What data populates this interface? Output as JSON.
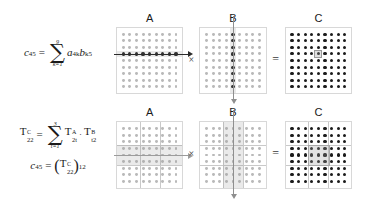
{
  "figure": {
    "background_color": "#ffffff",
    "dot_color_light": "#b9b9b9",
    "dot_color_dark": "#1b1b1b",
    "highlight_color": "#a0a0a0"
  },
  "top_row": {
    "formula": {
      "lhs_var": "c",
      "lhs_sub": "45",
      "equals": "=",
      "sum_symbol": "∑",
      "sum_upper": "9",
      "sum_lower": "k=1",
      "term1_var": "a",
      "term1_sub": "4k",
      "term2_var": "b",
      "term2_sub": "k5"
    },
    "matrices": [
      {
        "label": "A",
        "rows": 9,
        "cols": 9,
        "dot_style": "light",
        "highlight": "row",
        "highlight_index": 4,
        "arrow": "horizontal-right"
      },
      {
        "label": "B",
        "rows": 9,
        "cols": 9,
        "dot_style": "light",
        "highlight": "column",
        "highlight_index": 5,
        "arrow": "vertical-down"
      },
      {
        "label": "C",
        "rows": 9,
        "cols": 9,
        "dot_style": "dark",
        "highlight": "cell",
        "highlight_row": 4,
        "highlight_col": 5,
        "arrow": "none"
      }
    ],
    "operators": {
      "multiply": "×",
      "equals": "="
    }
  },
  "bottom_row": {
    "formula_line1": {
      "lhs_symbol": "T",
      "lhs_sup": "C",
      "lhs_sub": "22",
      "equals": "=",
      "sum_symbol": "∑",
      "sum_upper": "3",
      "sum_lower": "t=1",
      "term1_symbol": "T",
      "term1_sup": "A",
      "term1_sub": "2t",
      "middot": "·",
      "term2_symbol": "T",
      "term2_sup": "B",
      "term2_sub": "t2"
    },
    "formula_line2": {
      "lhs_var": "c",
      "lhs_sub": "45",
      "equals": "=",
      "open_paren": "(",
      "inner_symbol": "T",
      "inner_sup": "C",
      "inner_sub": "22",
      "close_paren": ")",
      "outer_sub": "12"
    },
    "matrices": [
      {
        "label": "A",
        "rows": 9,
        "cols": 9,
        "block_rows": 3,
        "block_cols": 3,
        "dot_style": "light",
        "highlight": "block-row",
        "highlight_index": 2,
        "arrow": "horizontal-right"
      },
      {
        "label": "B",
        "rows": 9,
        "cols": 9,
        "block_rows": 3,
        "block_cols": 3,
        "dot_style": "light",
        "highlight": "block-column",
        "highlight_index": 2,
        "arrow": "vertical-down"
      },
      {
        "label": "C",
        "rows": 9,
        "cols": 9,
        "block_rows": 3,
        "block_cols": 3,
        "dot_style": "dark",
        "highlight": "block-cell",
        "highlight_block_row": 2,
        "highlight_block_col": 2,
        "arrow": "none"
      }
    ],
    "operators": {
      "multiply": "×",
      "equals": "="
    }
  }
}
